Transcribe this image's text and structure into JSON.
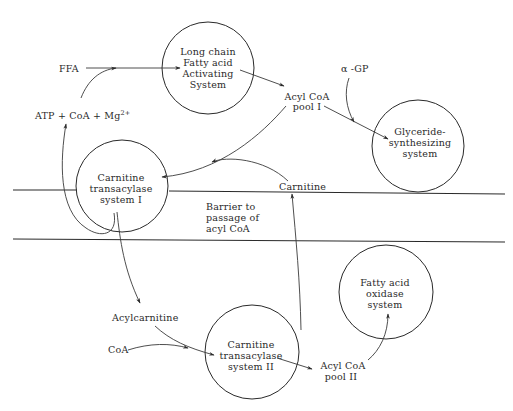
{
  "nodes": {
    "activating": {
      "lines": [
        "Long chain",
        "Fatty acid",
        "Activating",
        "System"
      ]
    },
    "glyceride": {
      "lines": [
        "Glyceride-",
        "synthesizing",
        "system"
      ]
    },
    "transacylase1": {
      "lines": [
        "Carnitine",
        "transacylase",
        "system I"
      ]
    },
    "oxidase": {
      "lines": [
        "Fatty acid",
        "oxidase",
        "system"
      ]
    },
    "transacylase2": {
      "lines": [
        "Carnitine",
        "transacylase",
        "system II"
      ]
    }
  },
  "labels": {
    "ffa": "FFA",
    "cofactors": "ATP + CoA + Mg",
    "cofactors_sup": "2+",
    "alpha_gp": "α -GP",
    "acyl_coa_pool1": [
      "Acyl CoA",
      "pool I"
    ],
    "carnitine": "Carnitine",
    "barrier": [
      "Barrier to",
      "passage of",
      "acyl CoA"
    ],
    "acylcarnitine": "Acylcarnitine",
    "coa": "CoA",
    "acyl_coa_pool2": [
      "Acyl CoA",
      "pool II"
    ]
  },
  "colors": {
    "ink": "#2a2a2a",
    "background": "#ffffff"
  }
}
